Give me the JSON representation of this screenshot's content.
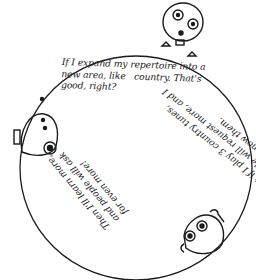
{
  "comic": {
    "speech_1": {
      "lines": [
        "If I expand my repertoire into a",
        "new area, like   country. That's",
        "good, right?"
      ]
    },
    "speech_2": {
      "lines": [
        "But if I play 3 country tunes,",
        "people will request more, and I",
        "won't know them."
      ]
    },
    "speech_3": {
      "lines": [
        "Then I'll learn more,",
        "and people will ask",
        "for even more!"
      ]
    },
    "characters": [
      "top-character",
      "left-character",
      "bottom-right-character"
    ],
    "colors": {
      "ink": "#1a1a1a",
      "paper": "#ffffff"
    }
  }
}
